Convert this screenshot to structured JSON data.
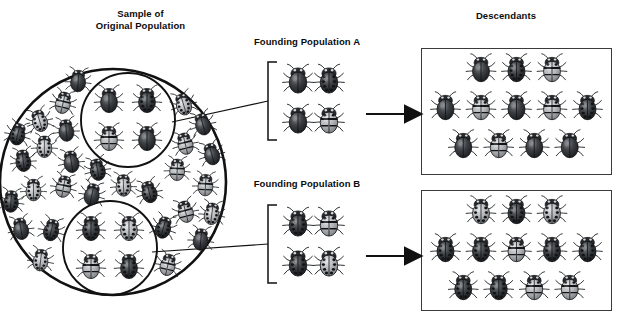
{
  "diagram": {
    "kind": "founder-effect-diagram",
    "background": "#ffffff",
    "ink": "#111111"
  },
  "labels": {
    "original_population": "Sample of\nOriginal Population",
    "founding_population_a": "Founding Population A",
    "founding_population_b": "Founding Population B",
    "descendants": "Descendants"
  },
  "original_population": {
    "outer_circle": {
      "cx": 113,
      "cy": 182,
      "r": 113
    },
    "sample_circles": [
      {
        "name": "sample-circle-a",
        "cx": 128,
        "cy": 120,
        "r": 47
      },
      {
        "name": "sample-circle-b",
        "cx": 110,
        "cy": 248,
        "r": 47
      }
    ],
    "outer_beetle_count": 30,
    "sample_a_beetles": [
      "plain-dark",
      "spotted-dark",
      "striped-light",
      "plain-dark"
    ],
    "sample_b_beetles": [
      "spotted-dark",
      "spotted-light",
      "striped-light",
      "spotted-dark"
    ]
  },
  "founding_population_a": {
    "bracket": {
      "x": 268,
      "y": 62,
      "width": 9,
      "height": 78
    },
    "beetles": [
      "plain-dark",
      "spotted-dark",
      "plain-dark",
      "striped-light"
    ]
  },
  "founding_population_b": {
    "bracket": {
      "x": 268,
      "y": 205,
      "width": 9,
      "height": 78
    },
    "beetles": [
      "spotted-dark",
      "striped-light",
      "spotted-dark",
      "spotted-light"
    ]
  },
  "arrows": [
    {
      "name": "arrow-a-to-descendants",
      "x1": 366,
      "y1": 114,
      "x2": 414,
      "y2": 114
    },
    {
      "name": "arrow-b-to-descendants",
      "x1": 366,
      "y1": 256,
      "x2": 414,
      "y2": 256
    }
  ],
  "connectors": [
    {
      "name": "connector-circle-a-to-bracket-a",
      "x1": 172,
      "y1": 122,
      "x2": 268,
      "y2": 101
    },
    {
      "name": "connector-circle-b-to-bracket-b",
      "x1": 152,
      "y1": 252,
      "x2": 268,
      "y2": 244
    }
  ],
  "descendants_top": {
    "rows": [
      [
        "plain-dark",
        "spotted-dark",
        "striped-light"
      ],
      [
        "plain-dark",
        "striped-light",
        "plain-dark",
        "striped-light",
        "spotted-dark"
      ],
      [
        "plain-dark",
        "striped-light",
        "plain-dark",
        "plain-dark"
      ]
    ],
    "count": 12
  },
  "descendants_bottom": {
    "rows": [
      [
        "spotted-light",
        "spotted-dark",
        "spotted-light"
      ],
      [
        "spotted-dark",
        "spotted-dark",
        "striped-light",
        "spotted-dark",
        "spotted-dark"
      ],
      [
        "spotted-dark",
        "spotted-dark",
        "striped-light",
        "striped-light"
      ]
    ],
    "count": 12
  },
  "colors": {
    "outline": "#111111",
    "box_border": "#3a3a3a",
    "beetle_dark": "#2f3134",
    "beetle_mid": "#6d7074",
    "beetle_light": "#b9bbbd",
    "beetle_spot": "#16181a"
  }
}
